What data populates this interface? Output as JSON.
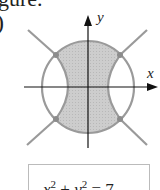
{
  "text": {
    "caption_fragment": "gure.",
    "label_fragment": ")"
  },
  "figure": {
    "x_label": "x",
    "y_label": "y",
    "circle": {
      "cx": 88,
      "cy": 87,
      "r": 46
    },
    "shaded_color": "#c8c8c8",
    "curve_color": "#9a9a9a",
    "axis_color": "#111111",
    "intersection_points": [
      [
        56,
        55
      ],
      [
        120,
        55
      ],
      [
        56,
        119
      ],
      [
        120,
        119
      ]
    ]
  },
  "equation_box": {
    "lhs_x": "x",
    "lhs_x_exp": "2",
    "plus": " + ",
    "lhs_y": "y",
    "lhs_y_exp": "2",
    "equals": " = ",
    "rhs": "7"
  }
}
